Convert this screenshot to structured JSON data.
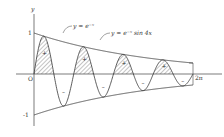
{
  "figure": {
    "axis_labels": {
      "y": "y",
      "origin": "O"
    },
    "ticks": {
      "top": "1",
      "bottom": "-1"
    },
    "curve_labels": {
      "envelope": "y = e⁻ˣ",
      "function": "y = e⁻ˣ sin 4x"
    },
    "period_label": "2π",
    "signs": {
      "plus": "+",
      "minus": "–"
    },
    "colors": {
      "ink": "#333333",
      "background": "#ffffff"
    }
  }
}
